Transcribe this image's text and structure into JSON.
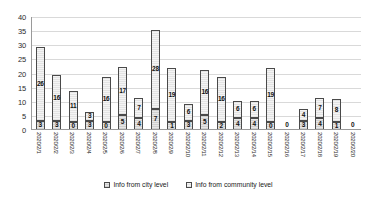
{
  "chart_data": {
    "type": "bar",
    "stacked": true,
    "title": "",
    "xlabel": "",
    "ylabel": "",
    "ylim": [
      0,
      40
    ],
    "yticks": [
      0,
      5,
      10,
      15,
      20,
      25,
      30,
      35,
      40
    ],
    "grid": true,
    "legend_position": "bottom",
    "categories": [
      "2020/2/1",
      "2020/2/2",
      "2020/2/3",
      "2020/2/4",
      "2020/2/5",
      "2020/2/6",
      "2020/2/7",
      "2020/2/8",
      "2020/2/9",
      "2020/2/10",
      "2020/2/11",
      "2020/2/12",
      "2020/2/13",
      "2020/2/14",
      "2020/2/15",
      "2020/2/16",
      "2020/2/17",
      "2020/2/18",
      "2020/2/19",
      "2020/2/20"
    ],
    "series": [
      {
        "name": "Info from city level",
        "key": "city",
        "values": [
          3,
          3,
          0,
          3,
          0,
          5,
          4,
          7,
          1,
          3,
          5,
          2,
          4,
          4,
          0,
          0,
          3,
          4,
          1,
          0
        ]
      },
      {
        "name": "Info from community level",
        "key": "community",
        "values": [
          26,
          16,
          11,
          3,
          16,
          17,
          7,
          28,
          19,
          6,
          16,
          16,
          6,
          6,
          19,
          0,
          4,
          7,
          8,
          0
        ]
      }
    ],
    "totals": [
      29,
      19,
      11,
      6,
      16,
      22,
      11,
      35,
      20,
      9,
      21,
      18,
      10,
      10,
      19,
      0,
      7,
      11,
      9,
      0
    ]
  },
  "legend": {
    "items": [
      {
        "label": "Info from city level",
        "key": "city"
      },
      {
        "label": "Info from community level",
        "key": "community"
      }
    ]
  }
}
